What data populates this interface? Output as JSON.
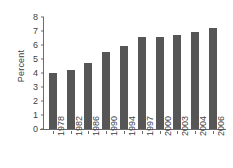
{
  "chart_data": {
    "type": "bar",
    "title": "",
    "subtitle": "",
    "xlabel": "",
    "ylabel": "Percent",
    "categories": [
      "1978",
      "1982",
      "1986",
      "1990",
      "1994",
      "1997",
      "2000",
      "2003",
      "2004",
      "2006"
    ],
    "values": [
      4.0,
      4.2,
      4.7,
      5.5,
      5.9,
      6.6,
      6.6,
      6.7,
      6.9,
      7.2
    ],
    "ylim": [
      0,
      8
    ],
    "ytick_labels": [
      "8",
      "7",
      "6",
      "5",
      "4",
      "3",
      "2",
      "1",
      "0"
    ],
    "ytick_values": [
      8,
      7,
      6,
      5,
      4,
      3,
      2,
      1,
      0
    ],
    "grid": false,
    "legend": false,
    "legend_position": "none",
    "bar_color": "#565656",
    "axis_color": "#6b6b6b",
    "background_color": "#ffffff"
  }
}
